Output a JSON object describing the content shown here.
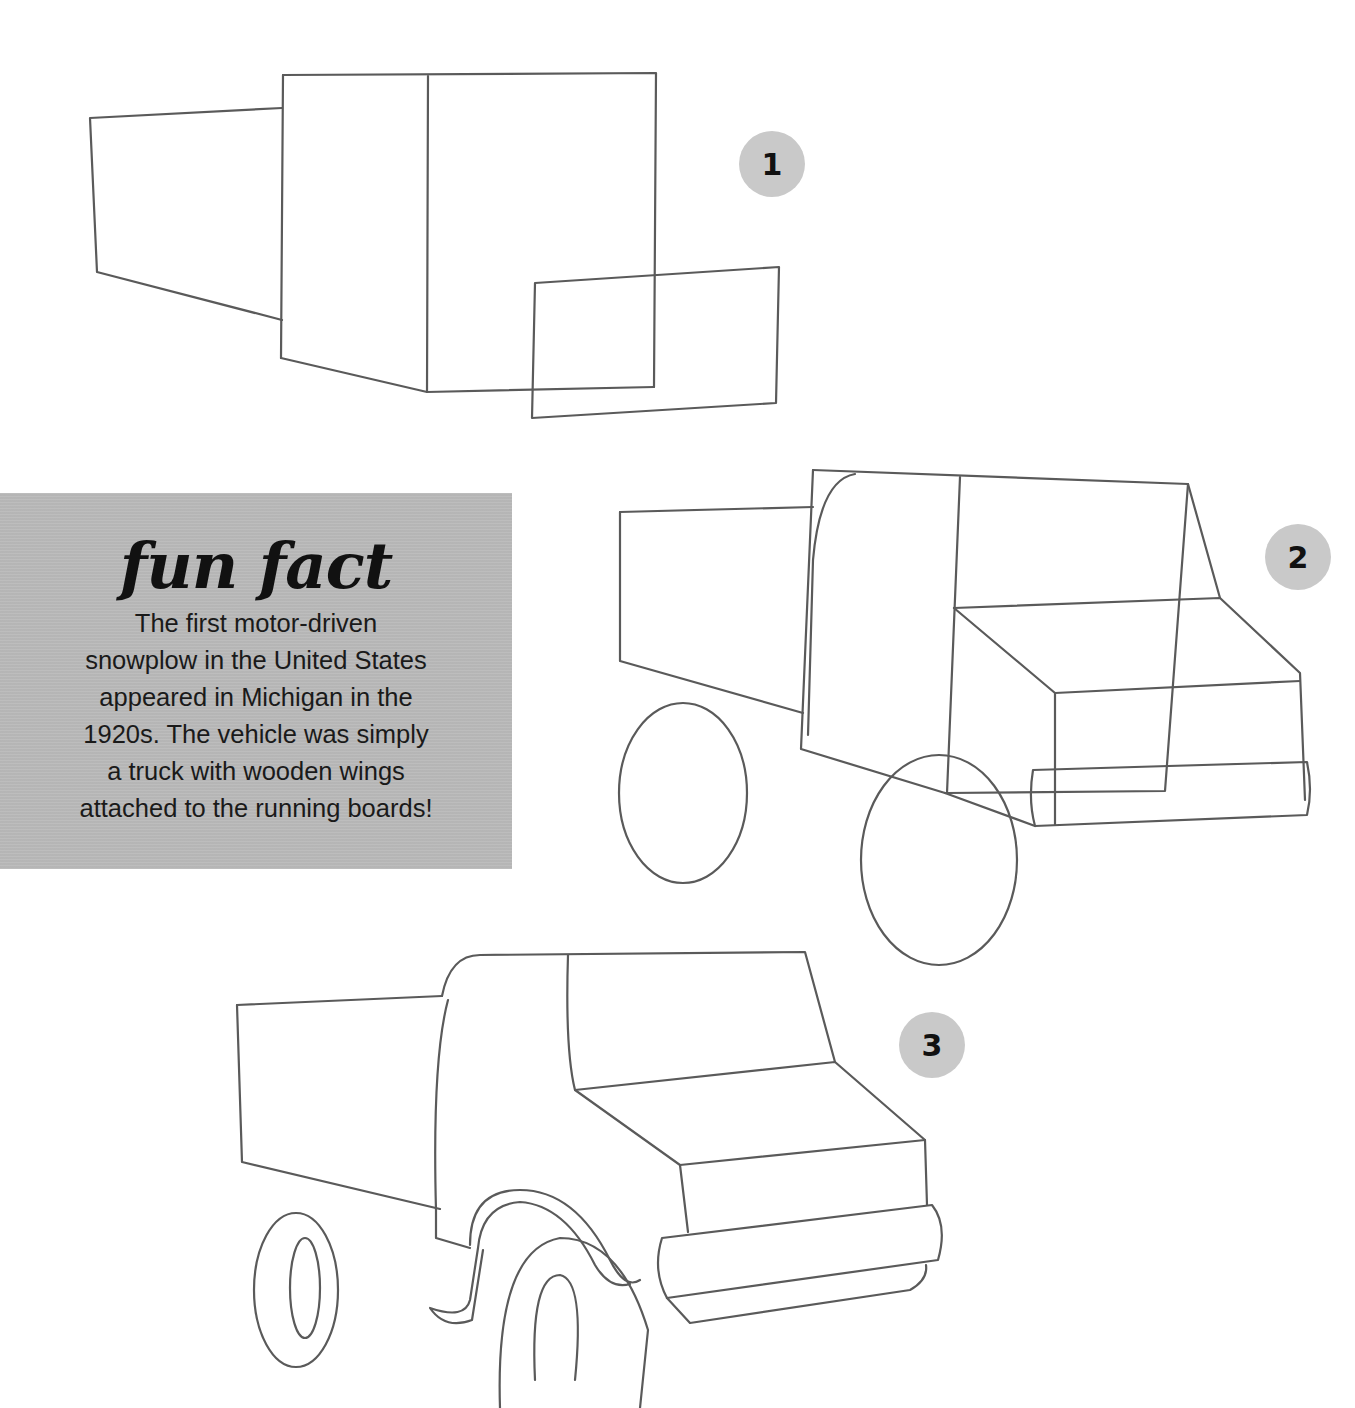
{
  "steps": [
    {
      "number": "1",
      "badge_color": "#c9c9c9"
    },
    {
      "number": "2",
      "badge_color": "#c9c9c9"
    },
    {
      "number": "3",
      "badge_color": "#c9c9c9"
    }
  ],
  "fun_fact": {
    "title": "fun fact",
    "lines": [
      "The first motor-driven",
      "snowplow in the United States",
      "appeared in Michigan in the",
      "1920s. The vehicle was simply",
      "a truck with wooden wings",
      "attached to the running boards!"
    ],
    "background_color": "#b9b9b9"
  },
  "drawing": {
    "stroke_color": "#5a5a5a",
    "subject": "truck step-by-step sketch"
  }
}
